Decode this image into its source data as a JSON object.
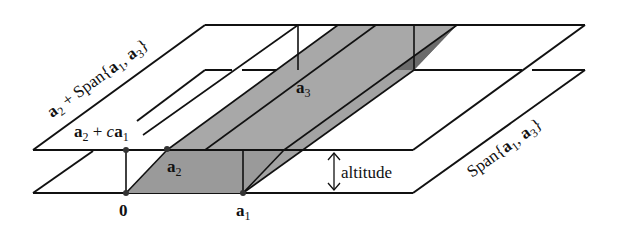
{
  "figure": {
    "colors": {
      "top_face": "#a3a3a3",
      "side_face": "#6b6b6b",
      "front_face": "#9a9a9a",
      "line": "#111111",
      "background": "#ffffff"
    }
  },
  "labels": {
    "upper_plane": {
      "vec": "a",
      "sub": "2",
      "plus": " + Span{",
      "v1": "a",
      "s1": "1",
      "comma": ", ",
      "v2": "a",
      "s2": "3",
      "close": "}"
    },
    "line_label": {
      "vec": "a",
      "sub": "2",
      "plus": " + ",
      "c": "c",
      "v1": "a",
      "s1": "1"
    },
    "lower_plane": {
      "pre": "Span{",
      "v1": "a",
      "s1": "1",
      "comma": ", ",
      "v2": "a",
      "s2": "3",
      "close": "}"
    },
    "origin": "0",
    "a1": {
      "vec": "a",
      "sub": "1"
    },
    "a2": {
      "vec": "a",
      "sub": "2"
    },
    "a3": {
      "vec": "a",
      "sub": "3"
    },
    "altitude": "altitude"
  }
}
